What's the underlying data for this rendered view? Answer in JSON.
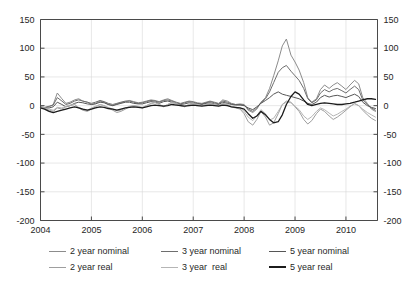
{
  "chart_data": {
    "type": "line",
    "title": "",
    "subtitle": "",
    "xlabel": "",
    "ylabel": "",
    "xlim": [
      2004.0,
      2010.62
    ],
    "ylim": [
      -200,
      150
    ],
    "grid": true,
    "legend_position": "bottom",
    "y_ticks": [
      150,
      100,
      50,
      0,
      -50,
      -100,
      -150,
      -200
    ],
    "y_tick_labels_left": [
      "150",
      "100",
      "50",
      "0",
      "-50",
      "-100",
      "-150",
      "-200"
    ],
    "y_tick_labels_right": [
      "150",
      "100",
      "50",
      "0",
      "-50",
      "-100",
      "-150",
      "-200"
    ],
    "x_ticks": [
      2004,
      2005,
      2006,
      2007,
      2008,
      2009,
      2010
    ],
    "x_tick_labels": [
      "2004",
      "2005",
      "2006",
      "2007",
      "2008",
      "2009",
      "2010"
    ],
    "dual_axis": true,
    "x": [
      2004.0,
      2004.08,
      2004.17,
      2004.25,
      2004.33,
      2004.42,
      2004.5,
      2004.58,
      2004.67,
      2004.75,
      2004.83,
      2004.92,
      2005.0,
      2005.08,
      2005.17,
      2005.25,
      2005.33,
      2005.42,
      2005.5,
      2005.58,
      2005.67,
      2005.75,
      2005.83,
      2005.92,
      2006.0,
      2006.08,
      2006.17,
      2006.25,
      2006.33,
      2006.42,
      2006.5,
      2006.58,
      2006.67,
      2006.75,
      2006.83,
      2006.92,
      2007.0,
      2007.08,
      2007.17,
      2007.25,
      2007.33,
      2007.42,
      2007.5,
      2007.58,
      2007.67,
      2007.75,
      2007.83,
      2007.92,
      2008.0,
      2008.08,
      2008.17,
      2008.25,
      2008.33,
      2008.42,
      2008.5,
      2008.58,
      2008.67,
      2008.75,
      2008.83,
      2008.92,
      2009.0,
      2009.08,
      2009.17,
      2009.25,
      2009.33,
      2009.42,
      2009.5,
      2009.58,
      2009.67,
      2009.75,
      2009.83,
      2009.92,
      2010.0,
      2010.08,
      2010.17,
      2010.25,
      2010.33,
      2010.42,
      2010.5,
      2010.58
    ],
    "series": [
      {
        "name": "2 year nominal",
        "color": "#8c8c8c",
        "width": 1.0,
        "values": [
          -3,
          -4,
          -2,
          2,
          22,
          12,
          4,
          6,
          10,
          12,
          8,
          6,
          2,
          4,
          8,
          6,
          2,
          0,
          3,
          5,
          7,
          9,
          7,
          5,
          6,
          8,
          10,
          9,
          7,
          10,
          12,
          9,
          6,
          4,
          6,
          8,
          7,
          5,
          4,
          6,
          8,
          6,
          4,
          10,
          8,
          4,
          2,
          3,
          2,
          -8,
          -12,
          -6,
          6,
          14,
          30,
          52,
          78,
          104,
          116,
          88,
          76,
          62,
          40,
          14,
          6,
          12,
          28,
          36,
          30,
          36,
          40,
          34,
          28,
          36,
          44,
          38,
          14,
          4,
          -6,
          -10
        ]
      },
      {
        "name": "3 year nominal",
        "color": "#6e6e6e",
        "width": 1.0,
        "values": [
          -2,
          -3,
          -1,
          1,
          14,
          8,
          2,
          4,
          8,
          10,
          8,
          6,
          4,
          6,
          9,
          7,
          4,
          2,
          4,
          6,
          8,
          8,
          6,
          4,
          5,
          7,
          9,
          8,
          6,
          9,
          10,
          8,
          5,
          3,
          5,
          7,
          6,
          4,
          3,
          5,
          7,
          5,
          3,
          8,
          6,
          3,
          2,
          2,
          1,
          -6,
          -10,
          -4,
          5,
          12,
          24,
          40,
          58,
          66,
          70,
          60,
          52,
          44,
          30,
          12,
          5,
          10,
          22,
          28,
          24,
          28,
          30,
          26,
          22,
          28,
          34,
          28,
          10,
          2,
          -4,
          -8
        ]
      },
      {
        "name": "5 year nominal",
        "color": "#565656",
        "width": 1.0,
        "values": [
          -3,
          -5,
          -4,
          -2,
          6,
          2,
          -2,
          0,
          4,
          6,
          5,
          3,
          2,
          3,
          6,
          5,
          2,
          0,
          2,
          4,
          6,
          6,
          4,
          3,
          3,
          5,
          7,
          6,
          4,
          7,
          8,
          6,
          3,
          2,
          3,
          5,
          4,
          3,
          2,
          4,
          5,
          3,
          2,
          6,
          4,
          2,
          1,
          1,
          0,
          -4,
          -7,
          -2,
          4,
          9,
          14,
          20,
          24,
          20,
          18,
          16,
          14,
          12,
          8,
          4,
          2,
          6,
          14,
          18,
          15,
          17,
          18,
          16,
          14,
          17,
          20,
          16,
          6,
          0,
          -3,
          -5
        ]
      },
      {
        "name": "2 year real",
        "color": "#9e9e9e",
        "width": 1.0,
        "values": [
          -4,
          -5,
          -8,
          -10,
          -4,
          -6,
          -2,
          0,
          2,
          -4,
          -8,
          -10,
          -6,
          -2,
          2,
          0,
          -4,
          -8,
          -12,
          -10,
          -6,
          -2,
          0,
          -2,
          -4,
          0,
          4,
          6,
          2,
          -2,
          2,
          6,
          4,
          0,
          -2,
          2,
          4,
          2,
          0,
          2,
          4,
          2,
          0,
          4,
          2,
          -2,
          -4,
          -6,
          -14,
          -28,
          -34,
          -24,
          -10,
          -20,
          -34,
          -30,
          -14,
          2,
          8,
          6,
          -2,
          -10,
          -24,
          -32,
          -26,
          -14,
          -6,
          -10,
          -18,
          -24,
          -20,
          -14,
          -8,
          -2,
          4,
          0,
          -8,
          -16,
          -22,
          -26
        ]
      },
      {
        "name": "3 year  real",
        "color": "#b5b5b5",
        "width": 1.0,
        "values": [
          -3,
          -4,
          -6,
          -8,
          -3,
          -4,
          -1,
          1,
          2,
          -3,
          -6,
          -8,
          -4,
          -1,
          2,
          0,
          -3,
          -6,
          -9,
          -8,
          -4,
          -1,
          0,
          -1,
          -3,
          0,
          3,
          5,
          2,
          -1,
          2,
          5,
          3,
          0,
          -1,
          2,
          3,
          2,
          0,
          2,
          3,
          2,
          0,
          3,
          2,
          -1,
          -3,
          -4,
          -10,
          -20,
          -26,
          -18,
          -7,
          -14,
          -25,
          -22,
          -10,
          2,
          6,
          5,
          -1,
          -7,
          -18,
          -24,
          -19,
          -10,
          -4,
          -7,
          -13,
          -18,
          -15,
          -10,
          -6,
          -1,
          3,
          0,
          -6,
          -12,
          -16,
          -20
        ]
      },
      {
        "name": "5 year real",
        "color": "#1c1c1c",
        "width": 1.3,
        "values": [
          -4,
          -6,
          -10,
          -12,
          -10,
          -8,
          -6,
          -4,
          -2,
          -4,
          -6,
          -8,
          -6,
          -4,
          -2,
          -3,
          -5,
          -6,
          -8,
          -6,
          -4,
          -3,
          -2,
          -3,
          -4,
          -2,
          0,
          1,
          0,
          -1,
          0,
          2,
          1,
          0,
          -1,
          0,
          1,
          0,
          -1,
          0,
          1,
          0,
          -1,
          1,
          0,
          -2,
          -3,
          -4,
          -6,
          -14,
          -22,
          -18,
          -10,
          -16,
          -24,
          -30,
          -28,
          -16,
          2,
          16,
          24,
          20,
          10,
          2,
          0,
          2,
          4,
          5,
          4,
          3,
          2,
          2,
          3,
          4,
          6,
          8,
          10,
          12,
          12,
          11
        ]
      }
    ]
  },
  "legend": {
    "rows": [
      [
        {
          "label": "2 year nominal",
          "color": "#8c8c8c",
          "width": 1.0
        },
        {
          "label": "3 year nominal",
          "color": "#6e6e6e",
          "width": 1.0
        },
        {
          "label": "5 year nominal",
          "color": "#565656",
          "width": 1.2
        }
      ],
      [
        {
          "label": "2 year real",
          "color": "#9e9e9e",
          "width": 1.0
        },
        {
          "label": "3 year  real",
          "color": "#b5b5b5",
          "width": 1.0
        },
        {
          "label": "5 year real",
          "color": "#1c1c1c",
          "width": 1.6
        }
      ]
    ]
  },
  "colors": {
    "axis": "#4a4a4a",
    "grid": "#d8d8d8",
    "background": "#ffffff",
    "text": "#262626"
  }
}
